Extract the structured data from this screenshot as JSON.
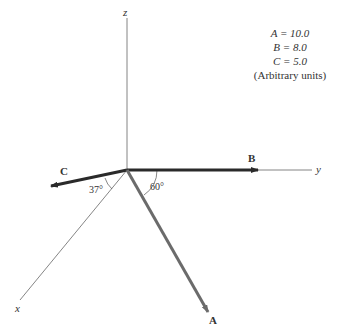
{
  "diagram": {
    "axes": {
      "x_label": "x",
      "y_label": "y",
      "z_label": "z"
    },
    "vectors": [
      {
        "name": "A",
        "magnitude": 10.0,
        "color": "#6b6b6b"
      },
      {
        "name": "B",
        "magnitude": 8.0,
        "color": "#2a2a2a"
      },
      {
        "name": "C",
        "magnitude": 5.0,
        "color": "#2a2a2a"
      }
    ],
    "angles": [
      {
        "label": "37°",
        "between": "C and x-axis"
      },
      {
        "label": "60°",
        "between": "A and y-axis"
      }
    ],
    "legend": {
      "lines": [
        "A = 10.0",
        "B = 8.0",
        "C = 5.0"
      ],
      "units": "(Arbitrary units)"
    },
    "labels": {
      "A": "A",
      "B": "B",
      "C": "C",
      "angle_37": "37°",
      "angle_60": "60°"
    }
  }
}
